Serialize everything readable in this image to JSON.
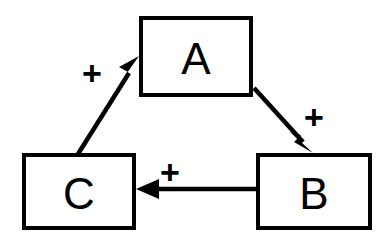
{
  "diagram": {
    "type": "signed-directed-graph",
    "title": "",
    "background_color": "#ffffff",
    "stroke_color": "#000000",
    "nodes": [
      {
        "id": "A",
        "label": "A",
        "x": 139,
        "y": 16,
        "width": 114,
        "height": 81
      },
      {
        "id": "B",
        "label": "B",
        "x": 256,
        "y": 153,
        "width": 116,
        "height": 77
      },
      {
        "id": "C",
        "label": "C",
        "x": 22,
        "y": 153,
        "width": 114,
        "height": 77
      }
    ],
    "edges": [
      {
        "id": "edge-c-to-a",
        "from": "C",
        "to": "A",
        "sign": "+",
        "sign_x": 92,
        "sign_y": 73,
        "direction": "up-right"
      },
      {
        "id": "edge-a-to-b",
        "from": "A",
        "to": "B",
        "sign": "+",
        "sign_x": 314,
        "sign_y": 117,
        "direction": "down-right"
      },
      {
        "id": "edge-b-to-c",
        "from": "B",
        "to": "C",
        "sign": "+",
        "sign_x": 170,
        "sign_y": 172,
        "direction": "left"
      }
    ]
  }
}
